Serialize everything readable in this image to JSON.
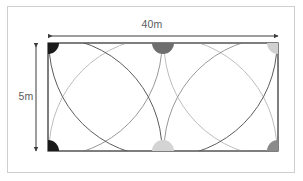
{
  "figure": {
    "frame_color": "#cfcfcf",
    "background": "#ffffff"
  },
  "labels": {
    "width": "40m",
    "height": "5m",
    "text_color": "#5b5b5b"
  },
  "rectangle": {
    "stroke": "#555555",
    "fill": "#ffffff",
    "x": 48,
    "y": 43,
    "width": 230,
    "height": 108
  },
  "dimensions": [
    {
      "name": "width-dimension",
      "label": "40m",
      "orientation": "horizontal",
      "x1": 48,
      "y1": 36,
      "x2": 278,
      "y2": 36,
      "stroke": "#3c3c3c"
    },
    {
      "name": "height-dimension",
      "label": "5m",
      "orientation": "vertical",
      "x1": 36,
      "y1": 43,
      "x2": 36,
      "y2": 151,
      "stroke": "#3c3c3c"
    }
  ],
  "markers": [
    {
      "name": "sprinkler-top-left",
      "cx": 48,
      "cy": 43,
      "color": "#1a1a1a",
      "shape": "quarter-circle",
      "r": 11
    },
    {
      "name": "sprinkler-top-center",
      "cx": 163,
      "cy": 43,
      "color": "#6e6e6e",
      "shape": "half-circle",
      "r": 11
    },
    {
      "name": "sprinkler-top-right",
      "cx": 278,
      "cy": 43,
      "color": "#d0d0d0",
      "shape": "quarter-circle",
      "r": 11
    },
    {
      "name": "sprinkler-bottom-left",
      "cx": 48,
      "cy": 151,
      "color": "#1a1a1a",
      "shape": "quarter-circle",
      "r": 11
    },
    {
      "name": "sprinkler-bottom-center",
      "cx": 163,
      "cy": 151,
      "color": "#d4d4d4",
      "shape": "half-circle",
      "r": 11
    },
    {
      "name": "sprinkler-bottom-right",
      "cx": 278,
      "cy": 151,
      "color": "#8a8a8a",
      "shape": "quarter-circle",
      "r": 11
    }
  ],
  "coverage_circles": [
    {
      "name": "coverage-top-left",
      "cx": 48,
      "cy": 43,
      "r": 114,
      "stroke": "#8c8c8c"
    },
    {
      "name": "coverage-top-center",
      "cx": 163,
      "cy": 43,
      "r": 114,
      "stroke": "#4a4a4a"
    },
    {
      "name": "coverage-top-right",
      "cx": 278,
      "cy": 43,
      "r": 114,
      "stroke": "#b5b5b5"
    },
    {
      "name": "coverage-bottom-left",
      "cx": 48,
      "cy": 151,
      "r": 114,
      "stroke": "#4a4a4a"
    },
    {
      "name": "coverage-bottom-center",
      "cx": 163,
      "cy": 151,
      "r": 114,
      "stroke": "#b5b5b5"
    },
    {
      "name": "coverage-bottom-right",
      "cx": 278,
      "cy": 151,
      "r": 114,
      "stroke": "#8c8c8c"
    }
  ]
}
